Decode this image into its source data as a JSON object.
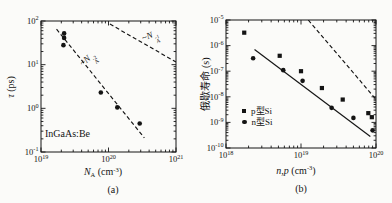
{
  "figure": {
    "background": "#fbfbf9",
    "ink": "#141414"
  },
  "chart_data": [
    {
      "type": "scatter",
      "caption": "(a)",
      "xlabel_text": "N_A (cm^-3)",
      "ylabel_text": "τ (ps)",
      "xlabel_parts": [
        [
          "N",
          "i"
        ],
        [
          "A",
          "sub"
        ],
        [
          " (cm",
          ""
        ],
        [
          "-3",
          "sup"
        ],
        [
          ")",
          ""
        ]
      ],
      "ylabel_parts": [
        [
          "τ",
          "i"
        ],
        [
          " (ps)",
          ""
        ]
      ],
      "x_axis": {
        "scale": "log",
        "exp_range": [
          19,
          21
        ],
        "tick_labels": [
          "10^19",
          "10^20",
          "10^21"
        ]
      },
      "y_axis": {
        "scale": "log",
        "exp_range": [
          -1,
          2
        ],
        "tick_labels": [
          "10^-1",
          "10^0",
          "10^1",
          "10^2"
        ]
      },
      "annotation": "InGaAs:Be",
      "series": [
        {
          "name": "InGaAs:Be lifetime",
          "marker": "circle",
          "points": [
            [
              2.2e+19,
              52
            ],
            [
              2.2e+19,
              41
            ],
            [
              2.15e+19,
              28
            ],
            [
              7.7e+19,
              2.3
            ],
            [
              1.35e+20,
              1.05
            ],
            [
              2.9e+20,
              0.45
            ]
          ]
        }
      ],
      "lines": [
        {
          "style": "dashed",
          "from": [
            1.7e+19,
            65
          ],
          "to": [
            3.4e+20,
            0.21
          ],
          "label_text": "~N_A^-2",
          "label_parts": [
            [
              "~",
              ""
            ],
            [
              "N",
              "i"
            ],
            [
              "A|-2",
              "stack"
            ]
          ]
        },
        {
          "style": "dashed",
          "from": [
            1.05e+20,
            85
          ],
          "to": [
            1e+21,
            11.5
          ],
          "label_text": "~N_A^-1",
          "label_parts": [
            [
              "~",
              ""
            ],
            [
              "N",
              "i"
            ],
            [
              "A|-1",
              "stack"
            ]
          ]
        }
      ]
    },
    {
      "type": "scatter",
      "caption": "(b)",
      "xlabel_text": "n,p (cm^-3)",
      "ylabel_text": "俄歇寿命 (s)",
      "xlabel_parts": [
        [
          "n",
          "i"
        ],
        [
          ",",
          ""
        ],
        [
          "p",
          "i"
        ],
        [
          " (cm",
          ""
        ],
        [
          "-3",
          "sup"
        ],
        [
          ")",
          ""
        ]
      ],
      "ylabel_parts": [
        [
          "俄歇寿命 (s)",
          ""
        ]
      ],
      "x_axis": {
        "scale": "log",
        "exp_range": [
          18,
          20
        ],
        "tick_labels": [
          "10^18",
          "10^19",
          "10^20"
        ]
      },
      "y_axis": {
        "scale": "log",
        "exp_range": [
          -10,
          -5
        ],
        "tick_labels": [
          "10^-10",
          "10^-9",
          "10^-8",
          "10^-7",
          "10^-6",
          "10^-5"
        ]
      },
      "legend": [
        {
          "marker": "square",
          "label": "p型Si"
        },
        {
          "marker": "circle",
          "label": "n型Si"
        }
      ],
      "series": [
        {
          "name": "p型Si",
          "marker": "square",
          "points": [
            [
              1.75e+18,
              3.2e-06
            ],
            [
              5.2e+18,
              4e-07
            ],
            [
              1e+19,
              1e-07
            ],
            [
              1.9e+19,
              2.2e-08
            ],
            [
              3.6e+19,
              7.8e-09
            ],
            [
              7.9e+19,
              2.3e-09
            ],
            [
              8.8e+19,
              1.6e-09
            ]
          ]
        },
        {
          "name": "n型Si",
          "marker": "circle",
          "points": [
            [
              2.3e+18,
              3.2e-07
            ],
            [
              5.8e+18,
              1.1e-07
            ],
            [
              1.05e+19,
              4.2e-08
            ],
            [
              2.56e+19,
              3.7e-09
            ],
            [
              5e+19,
              1.5e-09
            ],
            [
              9e+19,
              4.9e-10
            ]
          ]
        }
      ],
      "lines": [
        {
          "style": "solid",
          "from": [
            2.4e+18,
            7e-07
          ],
          "to": [
            8.4e+19,
            2.8e-10
          ]
        },
        {
          "style": "dashed",
          "from": [
            1.25e+19,
            1e-05
          ],
          "to": [
            9.8e+19,
            8.5e-09
          ]
        }
      ]
    }
  ]
}
